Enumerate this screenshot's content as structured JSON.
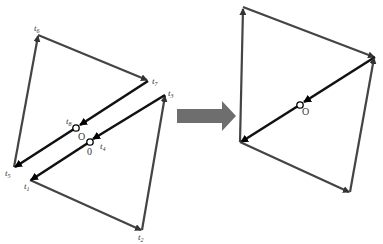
{
  "diagram": {
    "left_figure": {
      "labels": {
        "t1": {
          "base": "t",
          "sub": "1"
        },
        "t2": {
          "base": "t",
          "sub": "2"
        },
        "t3": {
          "base": "t",
          "sub": "3"
        },
        "t4": {
          "base": "t",
          "sub": "4"
        },
        "t5": {
          "base": "t",
          "sub": "5"
        },
        "t6": {
          "base": "t",
          "sub": "6"
        },
        "t7": {
          "base": "t",
          "sub": "7"
        },
        "t8": {
          "base": "t",
          "sub": "8"
        },
        "origin_upper": "O",
        "origin_lower": "0"
      }
    },
    "transform_arrow": {
      "color": "#707070",
      "direction": "right"
    },
    "right_figure": {
      "labels": {
        "origin": "O"
      }
    },
    "colors": {
      "edge": "#444444",
      "diagonal": "#111111",
      "arrow": "#6e6e6e"
    }
  }
}
